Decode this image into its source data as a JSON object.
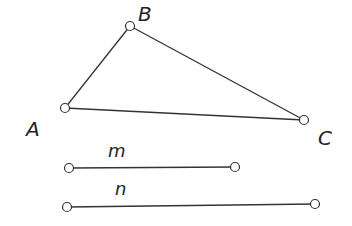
{
  "diagram": {
    "type": "geometry",
    "points": {
      "A": {
        "label": "A",
        "x": 65,
        "y": 108,
        "label_x": 26,
        "label_y": 136
      },
      "B": {
        "label": "B",
        "x": 130,
        "y": 26,
        "label_x": 138,
        "label_y": 21
      },
      "C": {
        "label": "C",
        "x": 304,
        "y": 120,
        "label_x": 318,
        "label_y": 145
      }
    },
    "triangle": {
      "name": "ABC",
      "vertices": [
        "A",
        "B",
        "C"
      ]
    },
    "segments": {
      "m": {
        "label": "m",
        "x1": 69,
        "y1": 168,
        "x2": 235,
        "y2": 167,
        "label_x": 108,
        "label_y": 157
      },
      "n": {
        "label": "n",
        "x1": 67,
        "y1": 207,
        "x2": 315,
        "y2": 204,
        "label_x": 115,
        "label_y": 195
      }
    },
    "colors": {
      "stroke": "#333333",
      "background": "#ffffff"
    }
  }
}
